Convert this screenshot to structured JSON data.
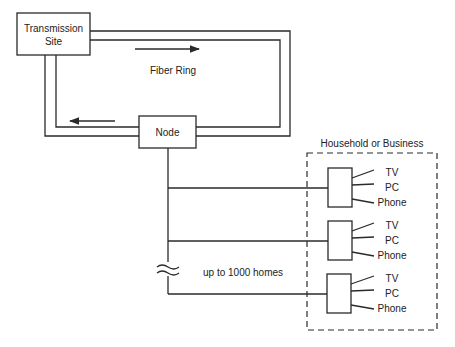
{
  "diagram": {
    "transmission_site": {
      "line1": "Transmission",
      "line2": "Site"
    },
    "fiber_ring_label": "Fiber Ring",
    "node_label": "Node",
    "household_title": "Household or Business",
    "homes_label": "up to 1000 homes",
    "break_symbol": "≈",
    "households": [
      {
        "devices": [
          "TV",
          "PC",
          "Phone"
        ]
      },
      {
        "devices": [
          "TV",
          "PC",
          "Phone"
        ]
      },
      {
        "devices": [
          "TV",
          "PC",
          "Phone"
        ]
      }
    ],
    "colors": {
      "line": "#2a2a2a",
      "text": "#222222",
      "background": "#ffffff"
    }
  }
}
